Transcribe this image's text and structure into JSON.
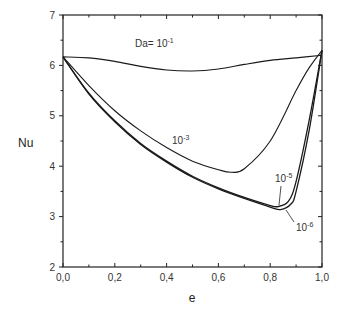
{
  "chart_data": {
    "type": "line",
    "title": "",
    "xlabel": "e",
    "ylabel": "Nu",
    "xlim": [
      0.0,
      1.0
    ],
    "ylim": [
      2,
      7
    ],
    "x_ticks": [
      "0,0",
      "0,2",
      "0,4",
      "0,6",
      "0,8",
      "1,0"
    ],
    "y_ticks": [
      "2",
      "3",
      "4",
      "5",
      "6",
      "7"
    ],
    "grid": false,
    "legend": "inline curve labels",
    "series": [
      {
        "name": "Da= 10^-1",
        "label_base": "Da= 10",
        "label_exp": "-1",
        "x": [
          0.0,
          0.1,
          0.2,
          0.3,
          0.4,
          0.5,
          0.6,
          0.7,
          0.8,
          0.9,
          1.0
        ],
        "y": [
          6.17,
          6.15,
          6.08,
          5.98,
          5.91,
          5.89,
          5.93,
          6.02,
          6.1,
          6.15,
          6.2
        ]
      },
      {
        "name": "10^-3",
        "label_base": "10",
        "label_exp": "-3",
        "x": [
          0.0,
          0.1,
          0.2,
          0.3,
          0.4,
          0.5,
          0.6,
          0.65,
          0.7,
          0.8,
          0.9,
          0.95,
          1.0
        ],
        "y": [
          6.17,
          5.6,
          5.1,
          4.7,
          4.37,
          4.1,
          3.93,
          3.88,
          3.95,
          4.5,
          5.5,
          5.95,
          6.3
        ]
      },
      {
        "name": "10^-5",
        "label_base": "10",
        "label_exp": "-5",
        "x": [
          0.0,
          0.1,
          0.2,
          0.3,
          0.4,
          0.5,
          0.6,
          0.7,
          0.8,
          0.83,
          0.87,
          0.9,
          0.95,
          1.0
        ],
        "y": [
          6.17,
          5.45,
          4.9,
          4.45,
          4.1,
          3.8,
          3.57,
          3.38,
          3.22,
          3.2,
          3.3,
          3.7,
          4.9,
          6.3
        ]
      },
      {
        "name": "10^-6",
        "label_base": "10",
        "label_exp": "-6",
        "x": [
          0.0,
          0.1,
          0.2,
          0.3,
          0.4,
          0.5,
          0.6,
          0.7,
          0.8,
          0.84,
          0.88,
          0.9,
          0.95,
          1.0
        ],
        "y": [
          6.17,
          5.43,
          4.88,
          4.43,
          4.08,
          3.78,
          3.55,
          3.36,
          3.19,
          3.14,
          3.25,
          3.5,
          4.7,
          6.3
        ]
      }
    ]
  }
}
